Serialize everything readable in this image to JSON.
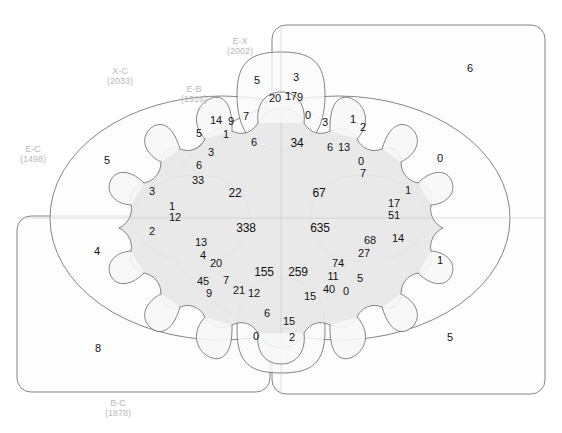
{
  "diagram": {
    "type": "venn",
    "title": "",
    "width": 562,
    "height": 433,
    "colors": {
      "outline": "#555555",
      "label_text": "#b9b9b9",
      "count_text": "#111111",
      "fill_light": "#fbfbfb",
      "fill_mid": "#f3f3f3",
      "fill_core": "#e6e6e6",
      "background": "#ffffff"
    }
  },
  "sets": [
    {
      "id": "EX",
      "name": "E-X",
      "size": "(2002)",
      "size_value": 2002,
      "label_x": 240,
      "label_y": 36
    },
    {
      "id": "XC",
      "name": "X-C",
      "size": "(2033)",
      "size_value": 2033,
      "label_x": 120,
      "label_y": 66
    },
    {
      "id": "EB",
      "name": "E-B",
      "size": "(1916)",
      "size_value": 1916,
      "label_x": 194,
      "label_y": 84
    },
    {
      "id": "EC",
      "name": "E-C",
      "size": "(1498)",
      "size_value": 1498,
      "label_x": 33,
      "label_y": 144
    },
    {
      "id": "BC",
      "name": "B-C",
      "size": "(1878)",
      "size_value": 1878,
      "label_x": 118,
      "label_y": 398
    }
  ],
  "regions": [
    {
      "id": "r-core-left-top",
      "value": "22",
      "x": 235,
      "y": 193,
      "size": "big"
    },
    {
      "id": "r-core-right-top",
      "value": "67",
      "x": 319,
      "y": 193,
      "size": "big"
    },
    {
      "id": "r-core-left-bottom",
      "value": "338",
      "x": 246,
      "y": 228,
      "size": "big"
    },
    {
      "id": "r-core-right-bottom",
      "value": "635",
      "x": 320,
      "y": 228,
      "size": "big"
    },
    {
      "id": "r-lower-left",
      "value": "155",
      "x": 264,
      "y": 272,
      "size": "big"
    },
    {
      "id": "r-lower-right",
      "value": "259",
      "x": 298,
      "y": 272,
      "size": "big"
    },
    {
      "id": "r-top-34",
      "value": "34",
      "x": 297,
      "y": 143,
      "size": "big"
    },
    {
      "id": "r-top-5",
      "value": "5",
      "x": 257,
      "y": 80
    },
    {
      "id": "r-top-3",
      "value": "3",
      "x": 296,
      "y": 77
    },
    {
      "id": "r-top-20",
      "value": "20",
      "x": 275,
      "y": 98
    },
    {
      "id": "r-top-17",
      "value": "17",
      "x": 291,
      "y": 96
    },
    {
      "id": "r-top-9",
      "value": "9",
      "x": 300,
      "y": 97
    },
    {
      "id": "r-top-0a",
      "value": "0",
      "x": 308,
      "y": 115
    },
    {
      "id": "r-top-3b",
      "value": "3",
      "x": 325,
      "y": 122
    },
    {
      "id": "r-top-6",
      "value": "6",
      "x": 330,
      "y": 147
    },
    {
      "id": "r-top-13",
      "value": "13",
      "x": 344,
      "y": 147
    },
    {
      "id": "r-top-1",
      "value": "1",
      "x": 353,
      "y": 119
    },
    {
      "id": "r-top-2",
      "value": "2",
      "x": 363,
      "y": 127
    },
    {
      "id": "r-top-0b",
      "value": "0",
      "x": 361,
      "y": 161
    },
    {
      "id": "r-top-7",
      "value": "7",
      "x": 363,
      "y": 173
    },
    {
      "id": "r-l-14",
      "value": "14",
      "x": 216,
      "y": 120
    },
    {
      "id": "r-l-9",
      "value": "9",
      "x": 231,
      "y": 121
    },
    {
      "id": "r-l-7",
      "value": "7",
      "x": 246,
      "y": 116
    },
    {
      "id": "r-l-5",
      "value": "5",
      "x": 199,
      "y": 133
    },
    {
      "id": "r-l-1",
      "value": "1",
      "x": 226,
      "y": 134
    },
    {
      "id": "r-l-6a",
      "value": "6",
      "x": 254,
      "y": 142
    },
    {
      "id": "r-l-3",
      "value": "3",
      "x": 211,
      "y": 152
    },
    {
      "id": "r-l-6b",
      "value": "6",
      "x": 199,
      "y": 165
    },
    {
      "id": "r-l-33",
      "value": "33",
      "x": 198,
      "y": 180
    },
    {
      "id": "r-l-3c",
      "value": "3",
      "x": 152,
      "y": 191
    },
    {
      "id": "r-l-1b",
      "value": "1",
      "x": 172,
      "y": 206
    },
    {
      "id": "r-l-12",
      "value": "12",
      "x": 175,
      "y": 217
    },
    {
      "id": "r-l-2",
      "value": "2",
      "x": 152,
      "y": 231
    },
    {
      "id": "r-l-13",
      "value": "13",
      "x": 201,
      "y": 242
    },
    {
      "id": "r-l-4",
      "value": "4",
      "x": 203,
      "y": 255
    },
    {
      "id": "r-l-20",
      "value": "20",
      "x": 216,
      "y": 263
    },
    {
      "id": "r-l-45",
      "value": "45",
      "x": 203,
      "y": 281
    },
    {
      "id": "r-l-7b",
      "value": "7",
      "x": 226,
      "y": 280
    },
    {
      "id": "r-l-9b",
      "value": "9",
      "x": 209,
      "y": 293
    },
    {
      "id": "r-l-21",
      "value": "21",
      "x": 239,
      "y": 290
    },
    {
      "id": "r-l-12b",
      "value": "12",
      "x": 254,
      "y": 293
    },
    {
      "id": "r-l-6c",
      "value": "6",
      "x": 267,
      "y": 313
    },
    {
      "id": "r-b-15a",
      "value": "15",
      "x": 289,
      "y": 321
    },
    {
      "id": "r-b-2",
      "value": "2",
      "x": 292,
      "y": 337
    },
    {
      "id": "r-b-0",
      "value": "0",
      "x": 256,
      "y": 336
    },
    {
      "id": "r-b-15b",
      "value": "15",
      "x": 310,
      "y": 296
    },
    {
      "id": "r-b-40",
      "value": "40",
      "x": 329,
      "y": 289
    },
    {
      "id": "r-b-0b",
      "value": "0",
      "x": 346,
      "y": 291
    },
    {
      "id": "r-r-17",
      "value": "17",
      "x": 394,
      "y": 203
    },
    {
      "id": "r-r-51",
      "value": "51",
      "x": 394,
      "y": 215
    },
    {
      "id": "r-r-1",
      "value": "1",
      "x": 408,
      "y": 190
    },
    {
      "id": "r-r-14",
      "value": "14",
      "x": 398,
      "y": 238
    },
    {
      "id": "r-r-68",
      "value": "68",
      "x": 370,
      "y": 240
    },
    {
      "id": "r-r-27",
      "value": "27",
      "x": 364,
      "y": 253
    },
    {
      "id": "r-r-74",
      "value": "74",
      "x": 338,
      "y": 263
    },
    {
      "id": "r-r-11",
      "value": "11",
      "x": 333,
      "y": 276
    },
    {
      "id": "r-r-5",
      "value": "5",
      "x": 360,
      "y": 278
    },
    {
      "id": "r-o-5left",
      "value": "5",
      "x": 107,
      "y": 160
    },
    {
      "id": "r-o-4",
      "value": "4",
      "x": 97,
      "y": 251
    },
    {
      "id": "r-o-8",
      "value": "8",
      "x": 98,
      "y": 348
    },
    {
      "id": "r-o-6",
      "value": "6",
      "x": 470,
      "y": 68
    },
    {
      "id": "r-o-0",
      "value": "0",
      "x": 440,
      "y": 158
    },
    {
      "id": "r-o-1",
      "value": "1",
      "x": 440,
      "y": 260
    },
    {
      "id": "r-o-5right",
      "value": "5",
      "x": 450,
      "y": 337
    }
  ]
}
